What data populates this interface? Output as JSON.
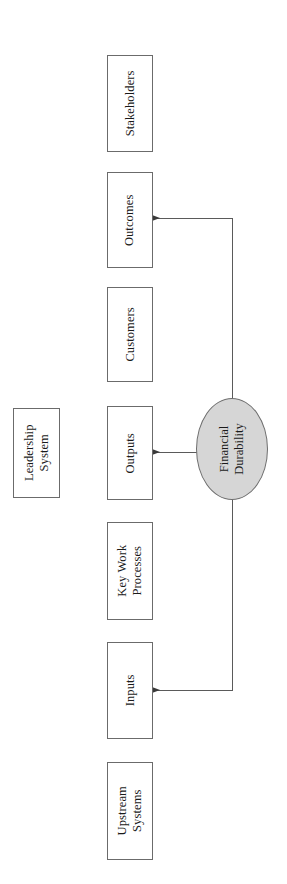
{
  "diagram": {
    "orientation": "rotated-90-ccw",
    "colors": {
      "hub_fill": "#d6d6d6",
      "box_fill": "#ffffff",
      "box_border": "#6b6b6b",
      "connector": "#5a5a5a",
      "text": "#1a1a1a",
      "background": "#ffffff"
    },
    "hub": {
      "label_line1": "Financial",
      "label_line2": "Durability"
    },
    "nodes": [
      {
        "id": "stakeholders",
        "label_line1": "Stakeholders",
        "label_line2": ""
      },
      {
        "id": "outcomes",
        "label_line1": "Outcomes",
        "label_line2": ""
      },
      {
        "id": "customers",
        "label_line1": "Customers",
        "label_line2": ""
      },
      {
        "id": "outputs",
        "label_line1": "Outputs",
        "label_line2": ""
      },
      {
        "id": "key-work-processes",
        "label_line1": "Key Work",
        "label_line2": "Processes"
      },
      {
        "id": "inputs",
        "label_line1": "Inputs",
        "label_line2": ""
      },
      {
        "id": "upstream-systems",
        "label_line1": "Upstream",
        "label_line2": "Systems"
      },
      {
        "id": "leadership-system",
        "label_line1": "Leadership",
        "label_line2": "System"
      }
    ],
    "connectors": [
      {
        "id": "hub-to-outcomes",
        "from": "financial-durability",
        "to": "outcomes",
        "arrow": "left"
      },
      {
        "id": "hub-to-outputs",
        "from": "financial-durability",
        "to": "outputs",
        "arrow": "left"
      },
      {
        "id": "hub-to-inputs",
        "from": "financial-durability",
        "to": "inputs",
        "arrow": "left"
      }
    ]
  }
}
